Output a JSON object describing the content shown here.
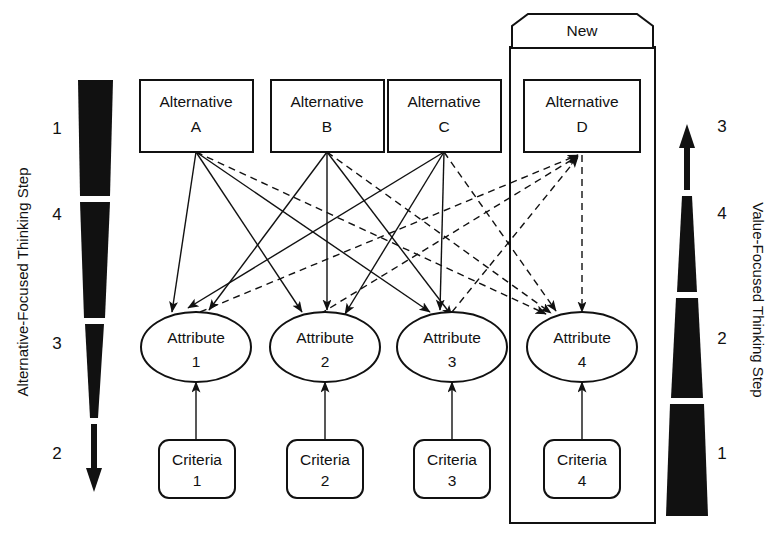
{
  "figure": {
    "new_badge": "New",
    "line_styles": {
      "existing": "solid",
      "new": "dashed"
    },
    "colors": {
      "ink": "#111111",
      "paper": "#ffffff"
    }
  },
  "left_axis": {
    "title": "Alternative-Focused Thinking Step",
    "direction": "down",
    "steps": [
      "1",
      "4",
      "3",
      "2"
    ]
  },
  "right_axis": {
    "title": "Value-Focused Thinking Step",
    "direction": "up",
    "steps": [
      "3",
      "4",
      "2",
      "1"
    ]
  },
  "alternatives": [
    {
      "line1": "Alternative",
      "line2": "A"
    },
    {
      "line1": "Alternative",
      "line2": "B"
    },
    {
      "line1": "Alternative",
      "line2": "C"
    },
    {
      "line1": "Alternative",
      "line2": "D"
    }
  ],
  "attributes": [
    {
      "line1": "Attribute",
      "line2": "1"
    },
    {
      "line1": "Attribute",
      "line2": "2"
    },
    {
      "line1": "Attribute",
      "line2": "3"
    },
    {
      "line1": "Attribute",
      "line2": "4"
    }
  ],
  "criteria": [
    {
      "line1": "Criteria",
      "line2": "1"
    },
    {
      "line1": "Criteria",
      "line2": "2"
    },
    {
      "line1": "Criteria",
      "line2": "3"
    },
    {
      "line1": "Criteria",
      "line2": "4"
    }
  ]
}
